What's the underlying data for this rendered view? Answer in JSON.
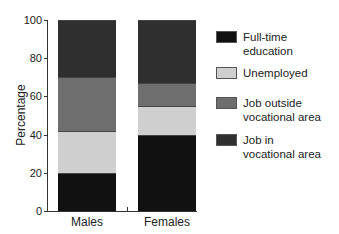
{
  "chart_data": {
    "type": "bar",
    "stacked": true,
    "title": "",
    "xlabel": "",
    "ylabel": "Percentage",
    "ylim": [
      0,
      100
    ],
    "yticks": [
      0,
      20,
      40,
      60,
      80,
      100
    ],
    "categories": [
      "Males",
      "Females"
    ],
    "series": [
      {
        "name": "Full-time education",
        "color": "#111111",
        "values": [
          20,
          40
        ]
      },
      {
        "name": "Unemployed",
        "color": "#cfcfcf",
        "values": [
          22,
          15
        ]
      },
      {
        "name": "Job outside vocational area",
        "color": "#6e6e6e",
        "values": [
          28,
          12
        ]
      },
      {
        "name": "Job in vocational area",
        "color": "#2f2f2f",
        "values": [
          30,
          33
        ]
      }
    ],
    "legend_position": "right"
  },
  "axis": {
    "ylabel": "Percentage",
    "ticks": [
      "0",
      "20",
      "40",
      "60",
      "80",
      "100"
    ]
  },
  "categories": [
    "Males",
    "Females"
  ],
  "legend": [
    {
      "line1": "Full-time education",
      "line2": "",
      "color": "#111111"
    },
    {
      "line1": "Unemployed",
      "line2": "",
      "color": "#cfcfcf"
    },
    {
      "line1": "Job outside",
      "line2": "vocational area",
      "color": "#6e6e6e"
    },
    {
      "line1": "Job in",
      "line2": "vocational area",
      "color": "#2f2f2f"
    }
  ]
}
